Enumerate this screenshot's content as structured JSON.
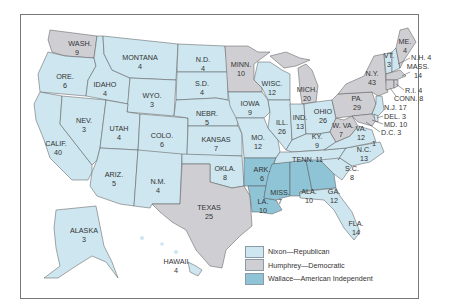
{
  "colors": {
    "nixon": "#cde6ef",
    "humphrey": "#cfcfd3",
    "wallace": "#8fc4d6",
    "water": "#ffffff",
    "border": "#555555"
  },
  "legend": [
    {
      "party": "nixon",
      "label": "Nixon—Republican"
    },
    {
      "party": "humphrey",
      "label": "Humphrey—Democratic"
    },
    {
      "party": "wallace",
      "label": "Wallace—American Independent"
    }
  ],
  "states": {
    "WA": {
      "name": "WASH.",
      "votes": "9",
      "party": "humphrey"
    },
    "OR": {
      "name": "ORE.",
      "votes": "6",
      "party": "nixon"
    },
    "CA": {
      "name": "CALIF.",
      "votes": "40",
      "party": "nixon"
    },
    "ID": {
      "name": "IDAHO",
      "votes": "4",
      "party": "nixon"
    },
    "NV": {
      "name": "NEV.",
      "votes": "3",
      "party": "nixon"
    },
    "MT": {
      "name": "MONTANA",
      "votes": "4",
      "party": "nixon"
    },
    "WY": {
      "name": "WYO.",
      "votes": "3",
      "party": "nixon"
    },
    "UT": {
      "name": "UTAH",
      "votes": "4",
      "party": "nixon"
    },
    "CO": {
      "name": "COLO.",
      "votes": "6",
      "party": "nixon"
    },
    "AZ": {
      "name": "ARIZ.",
      "votes": "5",
      "party": "nixon"
    },
    "NM": {
      "name": "N.M.",
      "votes": "4",
      "party": "nixon"
    },
    "ND": {
      "name": "N.D.",
      "votes": "4",
      "party": "nixon"
    },
    "SD": {
      "name": "S.D.",
      "votes": "4",
      "party": "nixon"
    },
    "NE": {
      "name": "NEBR.",
      "votes": "5",
      "party": "nixon"
    },
    "KS": {
      "name": "KANSAS",
      "votes": "7",
      "party": "nixon"
    },
    "OK": {
      "name": "OKLA.",
      "votes": "8",
      "party": "nixon"
    },
    "TX": {
      "name": "TEXAS",
      "votes": "25",
      "party": "humphrey"
    },
    "MN": {
      "name": "MINN.",
      "votes": "10",
      "party": "humphrey"
    },
    "IA": {
      "name": "IOWA",
      "votes": "9",
      "party": "nixon"
    },
    "MO": {
      "name": "MO.",
      "votes": "12",
      "party": "nixon"
    },
    "AR": {
      "name": "ARK.",
      "votes": "6",
      "party": "wallace"
    },
    "LA": {
      "name": "LA.",
      "votes": "10",
      "party": "wallace"
    },
    "WI": {
      "name": "WISC.",
      "votes": "12",
      "party": "nixon"
    },
    "IL": {
      "name": "ILL.",
      "votes": "26",
      "party": "nixon"
    },
    "MI": {
      "name": "MICH.",
      "votes": "20",
      "party": "humphrey"
    },
    "IN": {
      "name": "IND.",
      "votes": "13",
      "party": "nixon"
    },
    "OH": {
      "name": "OHIO",
      "votes": "26",
      "party": "nixon"
    },
    "KY": {
      "name": "KY.",
      "votes": "9",
      "party": "nixon"
    },
    "TN": {
      "name": "TENN.",
      "votes": "11",
      "party": "nixon"
    },
    "MS": {
      "name": "MISS.",
      "votes": "7",
      "party": "wallace"
    },
    "AL": {
      "name": "ALA.",
      "votes": "10",
      "party": "wallace"
    },
    "GA": {
      "name": "GA.",
      "votes": "12",
      "party": "wallace"
    },
    "FL": {
      "name": "FLA.",
      "votes": "14",
      "party": "nixon"
    },
    "SC": {
      "name": "S.C.",
      "votes": "8",
      "party": "nixon"
    },
    "NC": {
      "name": "N.C.",
      "votes": "13",
      "party": "nixon",
      "wallace_faithless": "1"
    },
    "VA": {
      "name": "VA.",
      "votes": "12",
      "party": "nixon"
    },
    "WV": {
      "name": "W. VA.",
      "votes": "7",
      "party": "humphrey"
    },
    "PA": {
      "name": "PA.",
      "votes": "29",
      "party": "humphrey"
    },
    "NY": {
      "name": "N.Y.",
      "votes": "43",
      "party": "humphrey"
    },
    "VT": {
      "name": "VT.",
      "votes": "3",
      "party": "nixon"
    },
    "NH": {
      "name": "N.H. 4",
      "votes": "4",
      "party": "nixon"
    },
    "ME": {
      "name": "ME.",
      "votes": "4",
      "party": "humphrey"
    },
    "MA": {
      "name": "MASS.",
      "votes": "14",
      "party": "humphrey"
    },
    "RI": {
      "name": "R.I. 4",
      "votes": "4",
      "party": "humphrey"
    },
    "CT": {
      "name": "CONN. 8",
      "votes": "8",
      "party": "humphrey"
    },
    "NJ": {
      "name": "N.J. 17",
      "votes": "17",
      "party": "nixon"
    },
    "DE": {
      "name": "DEL. 3",
      "votes": "3",
      "party": "nixon"
    },
    "MD": {
      "name": "MD. 10",
      "votes": "10",
      "party": "humphrey"
    },
    "DC": {
      "name": "D.C. 3",
      "votes": "3",
      "party": "humphrey"
    },
    "AK": {
      "name": "ALASKA",
      "votes": "3",
      "party": "nixon"
    },
    "HI": {
      "name": "HAWAII",
      "votes": "4",
      "party": "humphrey"
    }
  }
}
